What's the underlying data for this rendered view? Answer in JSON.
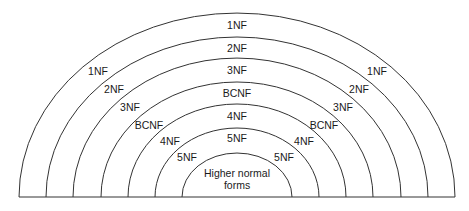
{
  "diagram": {
    "center": {
      "x": 237,
      "y": 197
    },
    "baseline": {
      "x1": 19,
      "x2": 455,
      "y": 197
    },
    "stroke_color": "#333333",
    "arcs": [
      {
        "name": "1NF",
        "rx": 218,
        "ry": 184
      },
      {
        "name": "2NF",
        "rx": 191,
        "ry": 160
      },
      {
        "name": "3NF",
        "rx": 164,
        "ry": 139
      },
      {
        "name": "BCNF",
        "rx": 136,
        "ry": 115
      },
      {
        "name": "4NF",
        "rx": 109,
        "ry": 93
      },
      {
        "name": "5NF",
        "rx": 82,
        "ry": 69
      },
      {
        "name": "Higher normal forms",
        "rx": 55,
        "ry": 44
      }
    ],
    "labels": {
      "top": [
        {
          "text": "1NF",
          "x": 237,
          "y": 29
        },
        {
          "text": "2NF",
          "x": 237,
          "y": 52
        },
        {
          "text": "3NF",
          "x": 237,
          "y": 74
        },
        {
          "text": "BCNF",
          "x": 237,
          "y": 97
        },
        {
          "text": "4NF",
          "x": 237,
          "y": 120
        },
        {
          "text": "5NF",
          "x": 237,
          "y": 142
        }
      ],
      "left": [
        {
          "text": "1NF",
          "x": 98,
          "y": 75
        },
        {
          "text": "2NF",
          "x": 114,
          "y": 93
        },
        {
          "text": "3NF",
          "x": 130,
          "y": 111
        },
        {
          "text": "BCNF",
          "x": 149,
          "y": 129
        },
        {
          "text": "4NF",
          "x": 170,
          "y": 145
        },
        {
          "text": "5NF",
          "x": 187,
          "y": 161
        }
      ],
      "right": [
        {
          "text": "1NF",
          "x": 377,
          "y": 75
        },
        {
          "text": "2NF",
          "x": 359,
          "y": 93
        },
        {
          "text": "3NF",
          "x": 343,
          "y": 111
        },
        {
          "text": "BCNF",
          "x": 324,
          "y": 129
        },
        {
          "text": "4NF",
          "x": 304,
          "y": 145
        },
        {
          "text": "5NF",
          "x": 284,
          "y": 161
        }
      ],
      "center": [
        {
          "text": "Higher normal",
          "x": 237,
          "y": 177
        },
        {
          "text": "forms",
          "x": 237,
          "y": 189
        }
      ]
    }
  }
}
